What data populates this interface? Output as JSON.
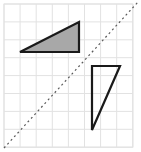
{
  "figure": {
    "width": 141,
    "height": 152,
    "background_color": "#ffffff"
  },
  "grid": {
    "name": "square-grid",
    "origin_x": 4,
    "origin_y": 4,
    "columns": 8,
    "rows": 8,
    "cell_width": 16.1,
    "cell_height": 17.9,
    "line_color": "#e2e2e2",
    "border_color": "#e2e2e2",
    "line_width": 1
  },
  "mirror_line": {
    "name": "mirror-line-y-equals-x",
    "style": "dashed",
    "color": "#5a5a5a",
    "line_width": 1.2,
    "dash_pattern": "2 3",
    "x1": 4,
    "y1": 148,
    "x2": 138,
    "y2": 2
  },
  "shapes": [
    {
      "name": "shaded-triangle",
      "label": "Shaded right triangle (pre-image)",
      "fill": "#a8a8a8",
      "stroke": "#1a1a1a",
      "stroke_width": 2.2,
      "filled": true,
      "points": [
        {
          "x": 20,
          "y": 52
        },
        {
          "x": 79,
          "y": 52
        },
        {
          "x": 79,
          "y": 22
        }
      ],
      "grid_points": [
        {
          "col": 1,
          "row": 2.7
        },
        {
          "col": 4.66,
          "row": 2.7
        },
        {
          "col": 4.66,
          "row": 1.0
        }
      ]
    },
    {
      "name": "outline-triangle",
      "label": "Unshaded right triangle (image)",
      "fill": "none",
      "stroke": "#1a1a1a",
      "stroke_width": 2.2,
      "filled": false,
      "points": [
        {
          "x": 92,
          "y": 66
        },
        {
          "x": 120,
          "y": 66
        },
        {
          "x": 92,
          "y": 130
        }
      ],
      "grid_points": [
        {
          "col": 5.47,
          "row": 3.46
        },
        {
          "col": 7.2,
          "row": 3.46
        },
        {
          "col": 5.47,
          "row": 7.04
        }
      ]
    }
  ]
}
